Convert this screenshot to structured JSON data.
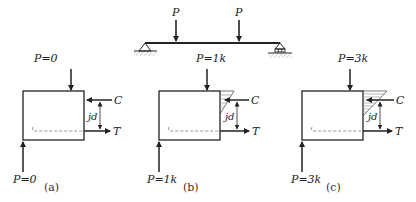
{
  "beam": {
    "load_label_left": "P",
    "load_label_right": "P",
    "support_left": "pin-support",
    "support_right": "roller-support"
  },
  "panels": [
    {
      "caption": "(a)",
      "top_load": "P=0",
      "bottom_load": "P=0",
      "compression_label": "C",
      "tension_label": "T",
      "lever_arm_label": "jd",
      "stress_block": "none"
    },
    {
      "caption": "(b)",
      "top_load": "P=1k",
      "bottom_load": "P=1k",
      "compression_label": "C",
      "tension_label": "T",
      "lever_arm_label": "jd",
      "stress_block": "small-triangle"
    },
    {
      "caption": "(c)",
      "top_load": "P=3k",
      "bottom_load": "P=3k",
      "compression_label": "C",
      "tension_label": "T",
      "lever_arm_label": "jd",
      "stress_block": "large-triangle"
    }
  ],
  "colors": {
    "stroke": "#222222",
    "dashed": "#888888",
    "hatch": "#999999"
  }
}
